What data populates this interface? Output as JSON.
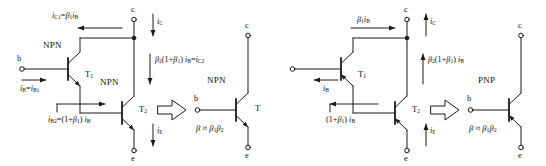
{
  "diagram": {
    "ink_color": "#111111",
    "line_color": "#1a1a1a"
  },
  "left_circuit": {
    "type_label_t1": "NPN",
    "type_label_t2": "NPN",
    "transistor1_name": "T1",
    "transistor2_name": "T2",
    "terminal_base": "b",
    "terminal_collector": "c",
    "terminal_emitter": "e",
    "current_base": "iB = iB1",
    "current_collector_t1": "iC1 = β1 iB",
    "current_collector": "iC",
    "current_collector_t2": "β2 (1+β1) iB = iC2",
    "current_base_t2": "iB2 = (1+β1) iB",
    "current_emitter": "iE"
  },
  "left_equivalent": {
    "type_label": "NPN",
    "transistor_name": "T",
    "terminal_base": "b",
    "terminal_collector": "c",
    "terminal_emitter": "e",
    "beta_relation": "β ≈ β1β2"
  },
  "right_circuit": {
    "type_label_t1": "",
    "transistor1_name": "T1",
    "transistor2_name": "T2",
    "terminal_collector": "c",
    "terminal_emitter": "e",
    "current_base": "iB",
    "current_collector_t1": "β1 iB",
    "current_collector": "iC",
    "current_collector_t2": "β2 (1+β1) iB",
    "current_base_t2": "(1+β1) iB",
    "current_emitter": "iE"
  },
  "right_equivalent": {
    "type_label": "PNP",
    "terminal_base": "b",
    "terminal_collector": "c",
    "terminal_emitter": "e",
    "beta_relation": "β ≈ β1β2"
  },
  "arrows": {
    "block_arrow_left": "implies-arrow",
    "block_arrow_right": "implies-arrow"
  }
}
